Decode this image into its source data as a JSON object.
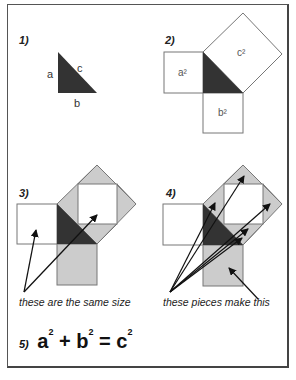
{
  "panels": [
    {
      "step": "1)",
      "labels": {
        "a": "a",
        "b": "b",
        "c": "c"
      }
    },
    {
      "step": "2)",
      "labels": {
        "a2": "a²",
        "b2": "b²",
        "c2": "c²"
      }
    },
    {
      "step": "3)",
      "caption": "these are the same size"
    },
    {
      "step": "4)",
      "caption": "these pieces make this"
    }
  ],
  "equation": {
    "step": "5)",
    "a": "a",
    "b": "b",
    "c": "c",
    "exp": "2",
    "plus": "+",
    "equals": "="
  },
  "colors": {
    "triangle": "#333333",
    "piece": "#cccccc",
    "outline": "#555555"
  }
}
